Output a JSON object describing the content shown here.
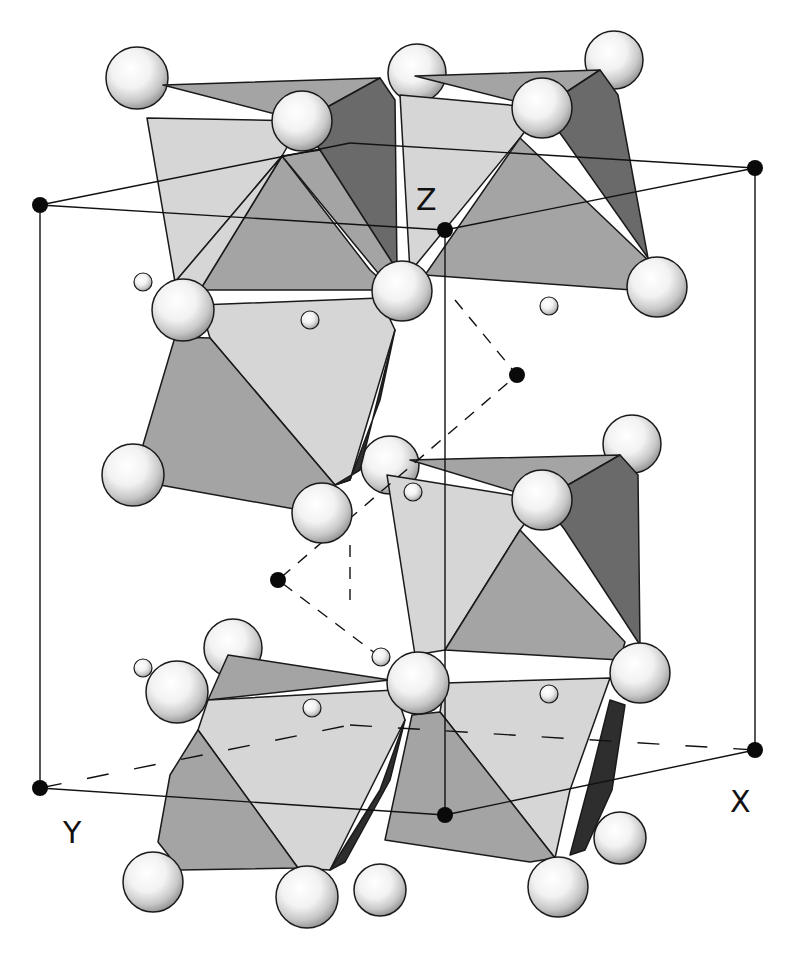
{
  "figure": {
    "type": "crystal-structure",
    "axis_labels": {
      "x": "X",
      "y": "Y",
      "z": "Z"
    }
  },
  "colors": {
    "background": "#ffffff",
    "face_light": "#d6d6d6",
    "face_mid": "#a4a4a4",
    "face_dark": "#6a6a6a",
    "face_darkest": "#2e2e2e",
    "edge": "#1a1a1a",
    "sphere_highlight": "#ffffff",
    "sphere_shadow": "#8a8a8a",
    "cell_line": "#111111",
    "cell_vertex": "#0a0a0a"
  },
  "unit_cell": {
    "vertices": {
      "top_left": [
        40,
        205
      ],
      "top_front": [
        445,
        230
      ],
      "top_right": [
        755,
        168
      ],
      "top_back": [
        350,
        143
      ],
      "bottom_left": [
        40,
        788
      ],
      "bottom_front": [
        445,
        815
      ],
      "bottom_right": [
        755,
        750
      ],
      "bottom_back": [
        350,
        725
      ]
    }
  },
  "zigzag_path": [
    [
      455,
      300
    ],
    [
      517,
      375
    ],
    [
      278,
      580
    ],
    [
      380,
      657
    ]
  ],
  "zigzag_vertices": [
    [
      517,
      375
    ],
    [
      278,
      580
    ]
  ],
  "large_spheres": [
    [
      137,
      78,
      31
    ],
    [
      417,
      73,
      29
    ],
    [
      302,
      121,
      30
    ],
    [
      614,
      60,
      29
    ],
    [
      542,
      108,
      30
    ],
    [
      183,
      310,
      31
    ],
    [
      402,
      291,
      30
    ],
    [
      657,
      287,
      30
    ],
    [
      133,
      475,
      31
    ],
    [
      322,
      513,
      30
    ],
    [
      390,
      465,
      30
    ],
    [
      632,
      444,
      30
    ],
    [
      542,
      500,
      30
    ],
    [
      233,
      648,
      29
    ],
    [
      177,
      692,
      31
    ],
    [
      418,
      683,
      31
    ],
    [
      640,
      673,
      30
    ],
    [
      153,
      882,
      30
    ],
    [
      307,
      897,
      31
    ],
    [
      558,
      887,
      30
    ],
    [
      620,
      838,
      26
    ],
    [
      380,
      890,
      26
    ]
  ],
  "small_spheres": [
    [
      143,
      282,
      9
    ],
    [
      310,
      320,
      9
    ],
    [
      549,
      306,
      9
    ],
    [
      413,
      492,
      9
    ],
    [
      143,
      668,
      9
    ],
    [
      312,
      708,
      9
    ],
    [
      381,
      657,
      9
    ],
    [
      549,
      694,
      9
    ]
  ]
}
